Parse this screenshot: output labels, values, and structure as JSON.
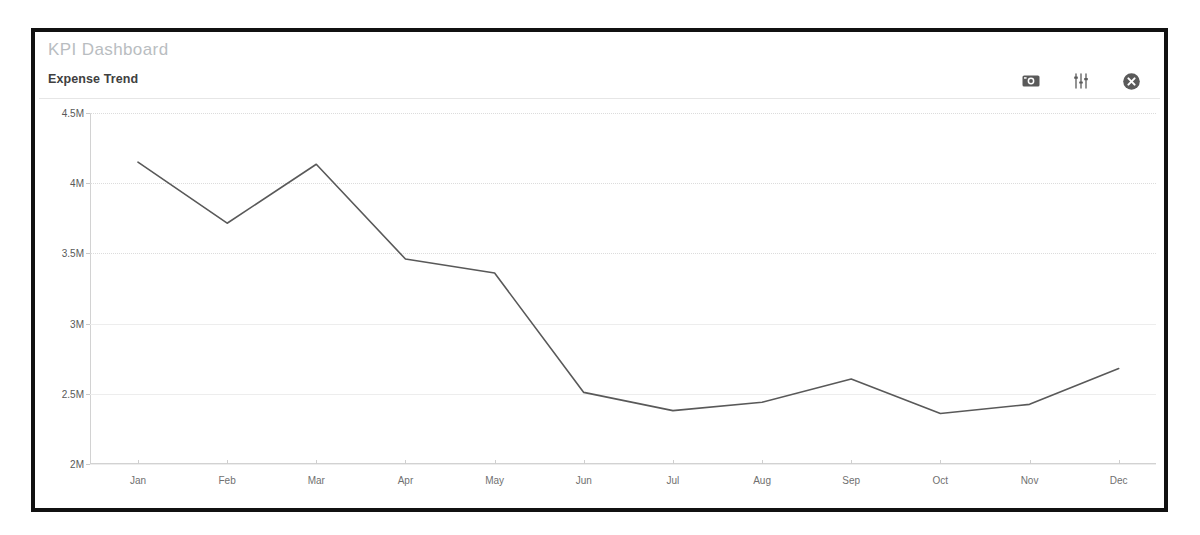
{
  "dashboard": {
    "title": "KPI Dashboard"
  },
  "chart_object": {
    "title": "Expense Trend",
    "actions": [
      {
        "name": "snapshot-icon",
        "label": "Snapshot"
      },
      {
        "name": "sliders-icon",
        "label": "Edit properties"
      },
      {
        "name": "close-icon",
        "label": "Close"
      }
    ]
  },
  "chart_data": {
    "type": "line",
    "title": "Expense Trend",
    "xlabel": "",
    "ylabel": "",
    "categories": [
      "Jan",
      "Feb",
      "Mar",
      "Apr",
      "May",
      "Jun",
      "Jul",
      "Aug",
      "Sep",
      "Oct",
      "Nov",
      "Dec"
    ],
    "values": [
      4150000,
      3715000,
      4135000,
      3460000,
      3360000,
      2510000,
      2380000,
      2440000,
      2605000,
      2360000,
      2425000,
      2680000
    ],
    "ylim": [
      2000000,
      4500000
    ],
    "ytick_values": [
      4500000,
      4000000,
      3500000,
      3000000,
      2500000,
      2000000
    ],
    "ytick_labels": [
      "4.5M",
      "4M",
      "3.5M",
      "3M",
      "2.5M",
      "2M"
    ],
    "grid": true,
    "legend": "none",
    "line_color": "#595959",
    "line_width": 1.6,
    "markers": false
  },
  "colors": {
    "panel_border": "#111111",
    "dashboard_title": "#b9bdc1",
    "chart_title": "#404040",
    "gridline": "#dcdcdc",
    "axis": "#d2d2d2",
    "tick_label": "#595959",
    "line": "#595959",
    "background": "#ffffff"
  }
}
